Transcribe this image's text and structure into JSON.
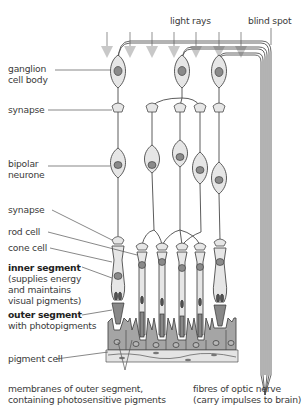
{
  "diagram": {
    "top_labels": {
      "light_rays": "light rays",
      "blind_spot": "blind spot"
    },
    "left_labels": [
      {
        "id": "ganglion",
        "lines": [
          "ganglion",
          "cell body"
        ],
        "bold": false
      },
      {
        "id": "synapse-top",
        "lines": [
          "synapse"
        ],
        "bold": false
      },
      {
        "id": "bipolar",
        "lines": [
          "bipolar",
          "neurone"
        ],
        "bold": false
      },
      {
        "id": "synapse-bottom",
        "lines": [
          "synapse"
        ],
        "bold": false
      },
      {
        "id": "rod-cell",
        "lines": [
          "rod cell"
        ],
        "bold": false
      },
      {
        "id": "cone-cell",
        "lines": [
          "cone cell"
        ],
        "bold": false
      },
      {
        "id": "inner-segment",
        "title": "inner segment",
        "lines": [
          "(supplies energy",
          "and maintains",
          "visual pigments)"
        ]
      },
      {
        "id": "outer-segment",
        "title": "outer segment",
        "lines": [
          "with photopigments"
        ]
      },
      {
        "id": "pigment-cell",
        "lines": [
          "pigment cell"
        ],
        "bold": false
      }
    ],
    "bottom_labels": {
      "membranes": [
        "membranes of outer segment,",
        "containing photosensitive pigments"
      ],
      "fibres": [
        "fibres of optic nerve",
        "(carry impulses to brain)"
      ]
    },
    "colors": {
      "cell_fill": "#e6e6e6",
      "nucleus": "#8a8a8a",
      "outline": "#4a4a4a",
      "light_arrow": "#c8c8c8",
      "pigment_fill": "#9a9a9a",
      "leader_line": "#555555"
    }
  }
}
